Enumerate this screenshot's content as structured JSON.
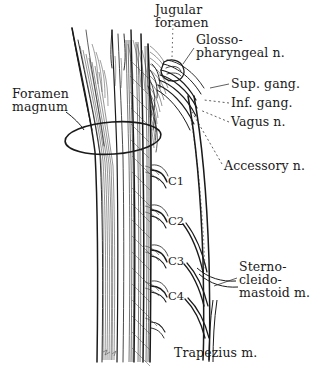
{
  "figure": {
    "background_color": "#ffffff",
    "ink_color": "#1a1a1a"
  },
  "labels": {
    "jugular_foramen_line1": "Jugular",
    "jugular_foramen_line2": "foramen",
    "glossopharyngeal_line1": "Glosso-",
    "glossopharyngeal_line2": "pharyngeal n.",
    "superior_ganglion": "Sup. gang.",
    "inferior_ganglion": "Inf. gang.",
    "vagus": "Vagus n.",
    "accessory": "Accessory n.",
    "sternocleidomastoid_line1": "Sterno-",
    "sternocleidomastoid_line2": "cleido-",
    "sternocleidomastoid_line3": "mastoid m.",
    "foramen_magnum_line1": "Foramen",
    "foramen_magnum_line2": "magnum",
    "trapezius": "Trapezius m."
  },
  "nerve_roots": {
    "c1": "C1",
    "c2": "C2",
    "c3": "C3",
    "c4": "C4"
  }
}
